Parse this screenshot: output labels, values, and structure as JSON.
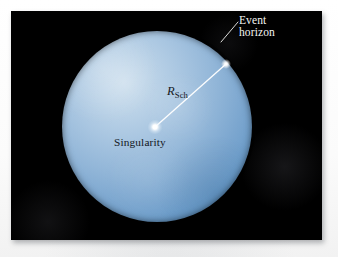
{
  "figure": {
    "kind": "astronomy-diagram",
    "panel_background_color": "#000000",
    "page_background_color": "#fdfdfd"
  },
  "sphere": {
    "name": "event-horizon-sphere",
    "fill_light_color": "#bdd4e8",
    "fill_mid_color": "#7ba6cf",
    "fill_dark_color": "#4f86bc",
    "center_x": 157,
    "center_y": 127,
    "radius": 95
  },
  "labels": {
    "event_horizon": {
      "line1": "Event",
      "line2": "horizon",
      "color": "#f4f4f2"
    },
    "schwarzschild_radius": {
      "symbol": "R",
      "subscript": "Sch",
      "color": "#14181c"
    },
    "singularity": {
      "text": "Singularity",
      "color": "#12161b"
    }
  },
  "markers": {
    "singularity_point": {
      "name": "singularity-point",
      "x": 155,
      "y": 127,
      "color": "#ffffff"
    },
    "horizon_contact_point": {
      "name": "radius-endpoint",
      "x": 226,
      "y": 64,
      "color": "#ffffff"
    }
  },
  "lines": {
    "radius_line": {
      "name": "schwarzschild-radius-line",
      "x1": 155,
      "y1": 127,
      "x2": 226,
      "y2": 64,
      "color": "#ffffff",
      "width": 1.3
    },
    "leader_line": {
      "name": "event-horizon-leader-line",
      "x1": 221,
      "y1": 42,
      "x2": 238,
      "y2": 21,
      "color": "#e8e8e6",
      "width": 1
    }
  }
}
